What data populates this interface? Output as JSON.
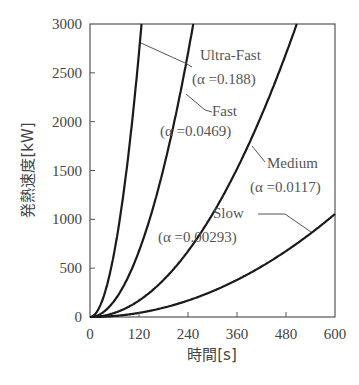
{
  "chart_data": {
    "type": "line",
    "title": "",
    "xlabel": "時間[s]",
    "ylabel": "発熱速度[kW]",
    "xlim": [
      0,
      600
    ],
    "ylim": [
      0,
      3000
    ],
    "xticks": [
      0,
      120,
      240,
      360,
      480,
      600
    ],
    "yticks": [
      0,
      500,
      1000,
      1500,
      2000,
      2500,
      3000
    ],
    "grid": false,
    "formula": "Q = alpha * t^2",
    "series": [
      {
        "name": "Ultra-Fast",
        "alpha_label": "(α =0.188)",
        "alpha": 0.188,
        "x": [
          0,
          30,
          60,
          90,
          120,
          126
        ],
        "values": [
          0,
          169,
          677,
          1523,
          2707,
          3000
        ]
      },
      {
        "name": "Fast",
        "alpha_label": "(α =0.0469)",
        "alpha": 0.0469,
        "x": [
          0,
          60,
          120,
          180,
          240,
          253
        ],
        "values": [
          0,
          169,
          675,
          1520,
          2701,
          3000
        ]
      },
      {
        "name": "Medium",
        "alpha_label": "(α =0.0117)",
        "alpha": 0.0117,
        "x": [
          0,
          120,
          240,
          360,
          480,
          506
        ],
        "values": [
          0,
          168,
          674,
          1516,
          2696,
          3000
        ]
      },
      {
        "name": "Slow",
        "alpha_label": "(α =0.00293)",
        "alpha": 0.00293,
        "x": [
          0,
          120,
          240,
          360,
          480,
          600
        ],
        "values": [
          0,
          42,
          169,
          380,
          675,
          1055
        ]
      }
    ]
  }
}
